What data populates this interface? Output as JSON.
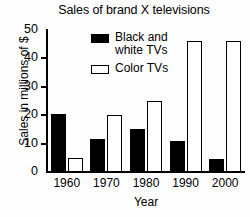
{
  "chart_data": {
    "type": "bar",
    "title": "Sales of brand X televisions",
    "xlabel": "Year",
    "ylabel": "Sales in millions of $",
    "categories": [
      "1960",
      "1970",
      "1980",
      "1990",
      "2000"
    ],
    "series": [
      {
        "name": "Black and\nwhite TVs",
        "values": [
          20.5,
          11.5,
          15,
          11,
          4.5
        ],
        "color": "#000000",
        "style": "filled"
      },
      {
        "name": "Color TVs",
        "values": [
          5,
          20,
          25,
          46,
          46
        ],
        "color": "#ffffff",
        "style": "outlined"
      }
    ],
    "ylim": [
      0,
      50
    ],
    "yticks": [
      0,
      10,
      20,
      30,
      40,
      50
    ],
    "ytick_labels": [
      "0",
      "10",
      "20",
      "30",
      "40",
      "50"
    ],
    "grid": false,
    "legend_position": "upper center"
  }
}
